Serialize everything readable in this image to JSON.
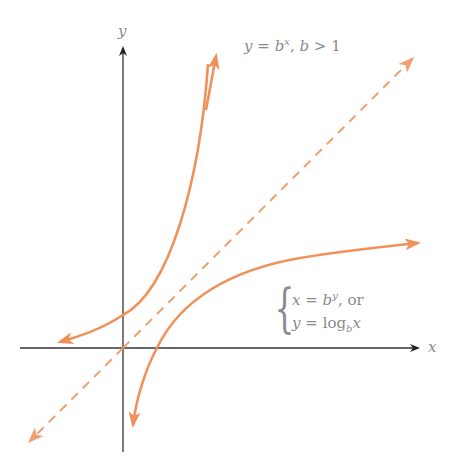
{
  "figure": {
    "axes": {
      "x_label": "x",
      "y_label": "y"
    },
    "curves": {
      "exponential": {
        "label_lhs": "y",
        "label_eq": "=",
        "label_base": "b",
        "label_exp": "x",
        "label_sep": ",",
        "label_cond_var": "b",
        "label_cond_op": ">",
        "label_cond_val": "1"
      },
      "logarithm": {
        "line1_lhs": "x",
        "line1_eq": "=",
        "line1_base": "b",
        "line1_exp": "y",
        "line1_tail": ", or",
        "line2_lhs": "y",
        "line2_eq": "=",
        "line2_log": "log",
        "line2_sub": "b",
        "line2_arg": "x"
      },
      "identity": {
        "style": "dashed",
        "description": "y = x"
      }
    },
    "colors": {
      "curve": "#f0915a",
      "dashed": "#f0a070",
      "axis": "#333333",
      "text": "#8a8a8a"
    }
  }
}
